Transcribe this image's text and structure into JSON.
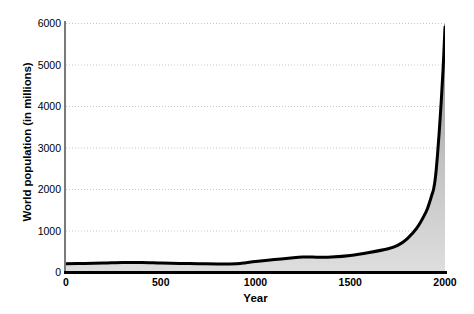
{
  "chart_data": {
    "type": "area",
    "title": "",
    "xlabel": "Year",
    "ylabel": "World population (in millions)",
    "xlim": [
      0,
      2000
    ],
    "ylim": [
      0,
      6000
    ],
    "grid": true,
    "legend": false,
    "x_ticks": [
      0,
      500,
      1000,
      1500,
      2000
    ],
    "x_tick_labels": [
      "0",
      "500",
      "1000",
      "1500",
      "2000"
    ],
    "y_ticks": [
      0,
      1000,
      2000,
      3000,
      4000,
      5000,
      6000
    ],
    "y_tick_labels": [
      "0",
      "1000",
      "2000",
      "3000",
      "4000",
      "5000",
      "6000"
    ],
    "series": [
      {
        "name": "World population",
        "x": [
          0,
          100,
          200,
          300,
          400,
          500,
          600,
          700,
          800,
          900,
          950,
          1000,
          1100,
          1200,
          1250,
          1300,
          1350,
          1400,
          1500,
          1600,
          1700,
          1750,
          1800,
          1850,
          1900,
          1920,
          1930,
          1940,
          1950,
          1960,
          1970,
          1980,
          1990,
          2000
        ],
        "y": [
          200,
          205,
          215,
          230,
          230,
          215,
          205,
          200,
          195,
          200,
          225,
          255,
          300,
          345,
          360,
          360,
          355,
          360,
          400,
          470,
          560,
          640,
          800,
          1050,
          1450,
          1700,
          1850,
          2000,
          2300,
          2800,
          3400,
          4100,
          4900,
          5900
        ]
      }
    ],
    "colors": {
      "line": "#000000",
      "fill_top": "#8e8e8e",
      "fill_bottom": "#dcdcdc",
      "grid": "#c8c8c8",
      "axis": "#000000",
      "background": "#ffffff"
    }
  },
  "axes": {
    "y_title": "World population (in millions)",
    "x_title": "Year"
  }
}
